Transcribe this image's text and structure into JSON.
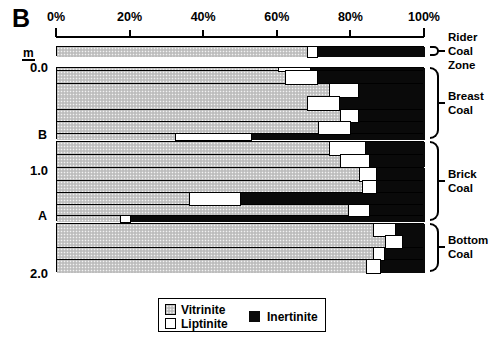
{
  "panel_letter": "B",
  "axis": {
    "unit_label": "m",
    "tick_labels": [
      "0%",
      "20%",
      "40%",
      "60%",
      "80%",
      "100%"
    ],
    "tick_values": [
      0,
      20,
      40,
      60,
      80,
      100
    ]
  },
  "depth_axis": {
    "labels": [
      "0.0",
      "1.0",
      "2.0"
    ],
    "values": [
      0.0,
      1.0,
      2.0
    ],
    "marker_labels": [
      "B",
      "A"
    ],
    "marker_values": [
      0.66,
      1.45
    ]
  },
  "groups": [
    {
      "name": "Rider Coal Zone",
      "label": "Rider\nCoal\nZone"
    },
    {
      "name": "Breast Coal",
      "label": "Breast\nCoal"
    },
    {
      "name": "Brick Coal",
      "label": "Brick\nCoal"
    },
    {
      "name": "Bottom Coal",
      "label": "Bottom\nCoal"
    }
  ],
  "legend": {
    "items": [
      {
        "key": "vit",
        "label": "Vitrinite",
        "color": "#c9c9c9"
      },
      {
        "key": "lip",
        "label": "Liptinite",
        "color": "#ffffff"
      },
      {
        "key": "ine",
        "label": "Inertinite",
        "color": "#0a0a0a"
      }
    ]
  },
  "chart_data": {
    "type": "bar",
    "orientation": "horizontal",
    "stacked": true,
    "title": "B",
    "xlabel": "",
    "ylabel": "m",
    "xlim": [
      0,
      100
    ],
    "xticks": [
      0,
      20,
      40,
      60,
      80,
      100
    ],
    "xticklabels": [
      "0%",
      "20%",
      "40%",
      "60%",
      "80%",
      "100%"
    ],
    "ylim": [
      2.15,
      -0.22
    ],
    "yticks": [
      0.0,
      1.0,
      2.0
    ],
    "yticklabels": [
      "0.0",
      "1.0",
      "2.0"
    ],
    "grid": false,
    "legend_position": "bottom-center",
    "series": [
      {
        "name": "Vitrinite",
        "color": "#c9c9c9"
      },
      {
        "name": "Liptinite",
        "color": "#ffffff"
      },
      {
        "name": "Inertinite",
        "color": "#0a0a0a"
      }
    ],
    "samples": [
      {
        "group": "Rider Coal Zone",
        "top": -0.2,
        "bottom": -0.1,
        "vitrinite": 68,
        "liptinite": 3,
        "inertinite": 29
      },
      {
        "group": "Breast Coal",
        "top": 0.0,
        "bottom": 0.035,
        "vitrinite": 60,
        "liptinite": 9,
        "inertinite": 31
      },
      {
        "group": "Breast Coal",
        "top": 0.035,
        "bottom": 0.16,
        "vitrinite": 62,
        "liptinite": 9,
        "inertinite": 29
      },
      {
        "group": "Breast Coal",
        "top": 0.16,
        "bottom": 0.29,
        "vitrinite": 74,
        "liptinite": 8,
        "inertinite": 18
      },
      {
        "group": "Breast Coal",
        "top": 0.29,
        "bottom": 0.41,
        "vitrinite": 68,
        "liptinite": 9,
        "inertinite": 23
      },
      {
        "group": "Breast Coal",
        "top": 0.41,
        "bottom": 0.53,
        "vitrinite": 77,
        "liptinite": 5,
        "inertinite": 18
      },
      {
        "group": "Breast Coal",
        "top": 0.53,
        "bottom": 0.64,
        "vitrinite": 71,
        "liptinite": 9,
        "inertinite": 20
      },
      {
        "group": "Breast Coal",
        "top": 0.64,
        "bottom": 0.7,
        "vitrinite": 32,
        "liptinite": 21,
        "inertinite": 47
      },
      {
        "group": "Brick Coal",
        "top": 0.72,
        "bottom": 0.85,
        "vitrinite": 74,
        "liptinite": 10,
        "inertinite": 16
      },
      {
        "group": "Brick Coal",
        "top": 0.85,
        "bottom": 0.97,
        "vitrinite": 77,
        "liptinite": 8,
        "inertinite": 15
      },
      {
        "group": "Brick Coal",
        "top": 0.97,
        "bottom": 1.1,
        "vitrinite": 82,
        "liptinite": 5,
        "inertinite": 13
      },
      {
        "group": "Brick Coal",
        "top": 1.1,
        "bottom": 1.22,
        "vitrinite": 83,
        "liptinite": 4,
        "inertinite": 13
      },
      {
        "group": "Brick Coal",
        "top": 1.22,
        "bottom": 1.33,
        "vitrinite": 36,
        "liptinite": 14,
        "inertinite": 50
      },
      {
        "group": "Brick Coal",
        "top": 1.33,
        "bottom": 1.44,
        "vitrinite": 79,
        "liptinite": 6,
        "inertinite": 15
      },
      {
        "group": "Brick Coal",
        "top": 1.44,
        "bottom": 1.5,
        "vitrinite": 17,
        "liptinite": 3,
        "inertinite": 80
      },
      {
        "group": "Bottom Coal",
        "top": 1.52,
        "bottom": 1.64,
        "vitrinite": 86,
        "liptinite": 6,
        "inertinite": 8
      },
      {
        "group": "Bottom Coal",
        "top": 1.64,
        "bottom": 1.75,
        "vitrinite": 89,
        "liptinite": 5,
        "inertinite": 6
      },
      {
        "group": "Bottom Coal",
        "top": 1.75,
        "bottom": 1.87,
        "vitrinite": 86,
        "liptinite": 3,
        "inertinite": 11
      },
      {
        "group": "Bottom Coal",
        "top": 1.87,
        "bottom": 1.99,
        "vitrinite": 84,
        "liptinite": 4,
        "inertinite": 12
      }
    ]
  }
}
